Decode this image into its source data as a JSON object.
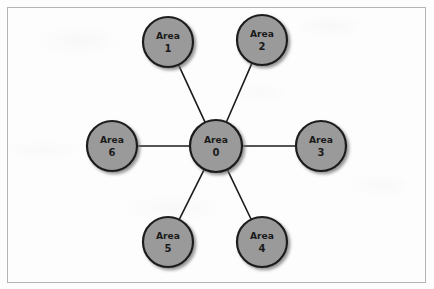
{
  "figure": {
    "name": "ospf-area-topology",
    "frame": {
      "x": 7,
      "y": 7,
      "width": 418,
      "height": 275
    },
    "colors": {
      "node_fill": "#9a9a9a",
      "node_stroke": "#1c1c1c",
      "link_stroke": "#1c1c1c",
      "label_text": "#1a1a1a",
      "frame_stroke": "#b4b4b4",
      "background": "#fdfdfd",
      "shadow": "#7a7a7a"
    },
    "nodes": [
      {
        "id": "area-0",
        "name_line": "Area",
        "number_line": "0",
        "cx": 216,
        "cy": 146,
        "r": 26,
        "role": "backbone"
      },
      {
        "id": "area-1",
        "name_line": "Area",
        "number_line": "1",
        "cx": 168,
        "cy": 42,
        "r": 25,
        "role": "spoke"
      },
      {
        "id": "area-2",
        "name_line": "Area",
        "number_line": "2",
        "cx": 262,
        "cy": 40,
        "r": 25,
        "role": "spoke"
      },
      {
        "id": "area-3",
        "name_line": "Area",
        "number_line": "3",
        "cx": 321,
        "cy": 146,
        "r": 25,
        "role": "spoke"
      },
      {
        "id": "area-4",
        "name_line": "Area",
        "number_line": "4",
        "cx": 262,
        "cy": 242,
        "r": 25,
        "role": "spoke"
      },
      {
        "id": "area-5",
        "name_line": "Area",
        "number_line": "5",
        "cx": 168,
        "cy": 242,
        "r": 25,
        "role": "spoke"
      },
      {
        "id": "area-6",
        "name_line": "Area",
        "number_line": "6",
        "cx": 112,
        "cy": 146,
        "r": 25,
        "role": "spoke"
      }
    ],
    "links": [
      {
        "id": "link-0-1",
        "from": "area-0",
        "to": "area-1"
      },
      {
        "id": "link-0-2",
        "from": "area-0",
        "to": "area-2"
      },
      {
        "id": "link-0-3",
        "from": "area-0",
        "to": "area-3"
      },
      {
        "id": "link-0-4",
        "from": "area-0",
        "to": "area-4"
      },
      {
        "id": "link-0-5",
        "from": "area-0",
        "to": "area-5"
      },
      {
        "id": "link-0-6",
        "from": "area-0",
        "to": "area-6"
      }
    ]
  }
}
